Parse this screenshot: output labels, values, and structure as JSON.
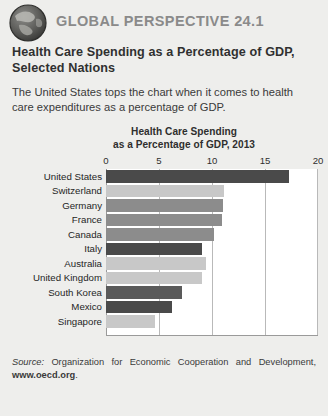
{
  "header": {
    "icon": "globe-icon",
    "kicker": "GLOBAL PERSPECTIVE 24.1"
  },
  "figure": {
    "title": "Health Care Spending as a Percentage of GDP, Selected Nations",
    "intro": "The United States tops the chart when it comes to health care expenditures as a percentage of GDP."
  },
  "source": {
    "lead": "Source:",
    "text": " Organization for Economic Cooperation and Development, ",
    "url": "www.oecd.org",
    "period": "."
  },
  "colors": {
    "page_background": "#eeeeec",
    "plot_background": "#ffffff",
    "gridline": "#b9b9b9",
    "bar_dark": "#4a4a4a",
    "bar_medium": "#8c8c8c",
    "bar_light": "#c8c8c8",
    "kicker": "#8a8a8a"
  },
  "chart_data": {
    "type": "bar",
    "orientation": "horizontal",
    "title": "Health Care Spending as a Percentage of GDP, 2013",
    "title_line1": "Health Care Spending",
    "title_line2": "as a Percentage of GDP, 2013",
    "xlabel": "",
    "ylabel": "",
    "xlim": [
      0,
      20
    ],
    "ticks": [
      0,
      5,
      10,
      15,
      20
    ],
    "grid": true,
    "legend": "none",
    "categories": [
      "United States",
      "Switzerland",
      "Germany",
      "France",
      "Canada",
      "Italy",
      "Australia",
      "United Kingdom",
      "South Korea",
      "Mexico",
      "Singapore"
    ],
    "values": [
      17.3,
      11.1,
      11.0,
      10.9,
      10.2,
      9.1,
      9.4,
      9.1,
      7.2,
      6.2,
      4.6
    ],
    "bar_colors": [
      "#4a4a4a",
      "#c8c8c8",
      "#8c8c8c",
      "#8c8c8c",
      "#8c8c8c",
      "#4a4a4a",
      "#c8c8c8",
      "#c8c8c8",
      "#5a5a5a",
      "#4a4a4a",
      "#c8c8c8"
    ]
  }
}
